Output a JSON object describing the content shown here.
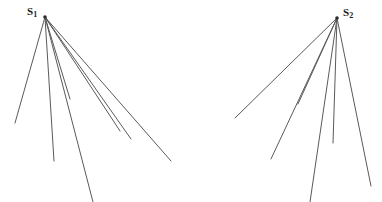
{
  "figure": {
    "background_color": "#ffffff",
    "line_color": "#5a5a5a",
    "apex_color": "#2b2b2b",
    "width": 382,
    "height": 202,
    "sources": [
      {
        "id": "source-1",
        "label_base": "S",
        "label_sub": "1",
        "label_text": "S1",
        "label_x": 27,
        "label_y": 6,
        "apex_x": 45,
        "apex_y": 17,
        "ray_count": 7,
        "rays": [
          {
            "name": "ray-1-1",
            "x2": 15,
            "y2": 123
          },
          {
            "name": "ray-1-2",
            "x2": 54,
            "y2": 161
          },
          {
            "name": "ray-1-3",
            "x2": 70,
            "y2": 99
          },
          {
            "name": "ray-1-4",
            "x2": 93,
            "y2": 202
          },
          {
            "name": "ray-1-5",
            "x2": 120,
            "y2": 131
          },
          {
            "name": "ray-1-6",
            "x2": 171,
            "y2": 161
          },
          {
            "name": "ray-1-7",
            "x2": 131,
            "y2": 139
          }
        ]
      },
      {
        "id": "source-2",
        "label_base": "S",
        "label_sub": "2",
        "label_text": "S2",
        "label_x": 343,
        "label_y": 7,
        "apex_x": 337,
        "apex_y": 18,
        "ray_count": 6,
        "rays": [
          {
            "name": "ray-2-1",
            "x2": 235,
            "y2": 118
          },
          {
            "name": "ray-2-2",
            "x2": 271,
            "y2": 159
          },
          {
            "name": "ray-2-3",
            "x2": 298,
            "y2": 104
          },
          {
            "name": "ray-2-4",
            "x2": 310,
            "y2": 202
          },
          {
            "name": "ray-2-5",
            "x2": 333,
            "y2": 143
          },
          {
            "name": "ray-2-6",
            "x2": 371,
            "y2": 186
          }
        ]
      }
    ]
  }
}
